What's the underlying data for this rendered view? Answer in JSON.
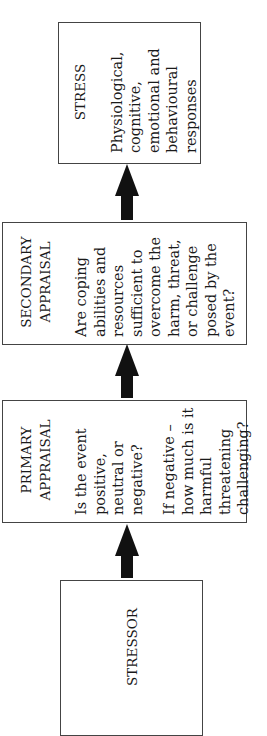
{
  "diagram": {
    "type": "flowchart",
    "orientation": "rotated-90-ccw",
    "boxes": [
      {
        "id": "stressor",
        "heading": "STRESSOR",
        "body": []
      },
      {
        "id": "primary",
        "heading_lines": [
          "PRIMARY",
          "APPRAISAL"
        ],
        "body": [
          "Is the event positive, neutral or negative?",
          "If negative – how much is it harmful threatening challenging?"
        ]
      },
      {
        "id": "secondary",
        "heading_lines": [
          "SECONDARY",
          "APPRAISAL"
        ],
        "body": [
          "Are coping abilities and resources sufficient to overcome the harm, threat, or challenge posed by the event?"
        ]
      },
      {
        "id": "stress",
        "heading": "STRESS",
        "body": [
          "Physiological, cognitive, emotional and behavioural responses"
        ]
      }
    ],
    "arrows": [
      {
        "from": "stressor",
        "to": "primary"
      },
      {
        "from": "primary",
        "to": "secondary"
      },
      {
        "from": "secondary",
        "to": "stress"
      }
    ],
    "colors": {
      "border": "#444444",
      "arrow": "#111111",
      "text": "#1a1a1a",
      "background": "#ffffff"
    }
  }
}
